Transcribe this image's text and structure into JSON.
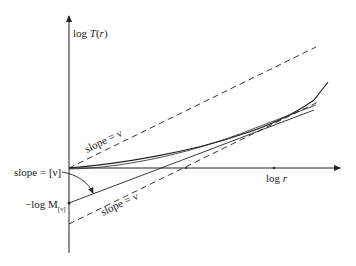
{
  "diagram": {
    "axes": {
      "y_label": "log T(r)",
      "x_label": "log r"
    },
    "annotations": {
      "slope_upper": "slope = ν",
      "slope_lower": "slope = ν",
      "slope_integer": "slope = [ν]",
      "intercept": "−log M",
      "intercept_subscript": "[ν]"
    },
    "lines": [
      {
        "name": "upper-dashed-asymptote",
        "style": "dashed",
        "from": [
          69,
          168
        ],
        "to": [
          316,
          47
        ]
      },
      {
        "name": "lower-dashed-asymptote",
        "style": "dashed",
        "from": [
          69,
          224
        ],
        "to": [
          318,
          102
        ]
      },
      {
        "name": "tangent-line",
        "style": "solid",
        "from": [
          69,
          203
        ],
        "to": [
          314,
          110
        ]
      },
      {
        "name": "curve-log-T",
        "style": "solid"
      }
    ],
    "colors": {
      "ink": "#222222",
      "background": "#ffffff"
    }
  }
}
